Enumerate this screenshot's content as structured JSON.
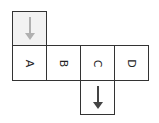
{
  "diagram": {
    "row": [
      {
        "label": "A"
      },
      {
        "label": "B"
      },
      {
        "label": "C"
      },
      {
        "label": "D"
      }
    ],
    "top_cell": {
      "above": "A",
      "icon": "arrow-down-icon",
      "color": "#b0b0b0",
      "background": "#f2f2f2"
    },
    "bottom_cell": {
      "below": "C",
      "icon": "arrow-down-icon",
      "color": "#444444"
    }
  }
}
